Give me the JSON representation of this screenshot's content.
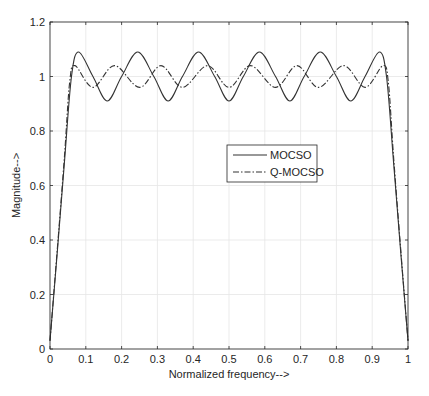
{
  "chart_data": {
    "type": "line",
    "title": "",
    "xlabel": "Normalized frequency-->",
    "ylabel": "Magnitude-->",
    "xlim": [
      0,
      1
    ],
    "ylim": [
      0,
      1.2
    ],
    "xticks": [
      "0",
      "0.1",
      "0.2",
      "0.3",
      "0.4",
      "0.5",
      "0.6",
      "0.7",
      "0.8",
      "0.9",
      "1"
    ],
    "yticks": [
      "0",
      "0.2",
      "0.4",
      "0.6",
      "0.8",
      "1",
      "1.2"
    ],
    "grid": true,
    "legend_position": "center-right inside",
    "series": [
      {
        "name": "MOCSO",
        "style": "solid",
        "color": "#333333",
        "x": [
          0,
          0.02,
          0.04,
          0.06,
          0.08,
          0.12,
          0.16,
          0.2,
          0.245,
          0.29,
          0.33,
          0.37,
          0.415,
          0.46,
          0.5,
          0.54,
          0.585,
          0.63,
          0.67,
          0.71,
          0.755,
          0.8,
          0.84,
          0.88,
          0.92,
          0.94,
          0.96,
          0.98,
          1
        ],
        "values": [
          0.03,
          0.35,
          0.68,
          1.0,
          1.09,
          1.0,
          0.91,
          1.0,
          1.09,
          1.0,
          0.91,
          1.0,
          1.09,
          1.0,
          0.91,
          1.0,
          1.09,
          1.0,
          0.91,
          1.0,
          1.09,
          1.0,
          0.91,
          1.0,
          1.09,
          1.0,
          0.68,
          0.35,
          0.03
        ]
      },
      {
        "name": "Q-MOCSO",
        "style": "dash-dot",
        "color": "#333333",
        "x": [
          0,
          0.02,
          0.04,
          0.055,
          0.07,
          0.12,
          0.18,
          0.25,
          0.31,
          0.37,
          0.44,
          0.5,
          0.56,
          0.63,
          0.69,
          0.75,
          0.82,
          0.88,
          0.93,
          0.945,
          0.96,
          0.98,
          1
        ],
        "values": [
          0.03,
          0.36,
          0.7,
          0.98,
          1.04,
          0.96,
          1.04,
          0.96,
          1.04,
          0.96,
          1.04,
          0.96,
          1.04,
          0.96,
          1.04,
          0.96,
          1.04,
          0.96,
          1.04,
          0.98,
          0.7,
          0.36,
          0.03
        ]
      }
    ]
  },
  "legend": {
    "items": [
      {
        "label": "MOCSO",
        "style": "solid"
      },
      {
        "label": "Q-MOCSO",
        "style": "dash-dot"
      }
    ]
  },
  "colors": {
    "axis": "#262626",
    "grid": "#e6e6e6",
    "line": "#333333",
    "background": "#ffffff"
  }
}
